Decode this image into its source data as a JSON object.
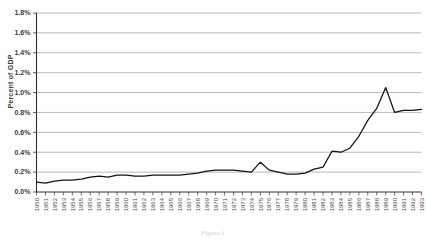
{
  "figure": {
    "caption": "Figure 1"
  },
  "axes": {
    "ylabel": "Percent of GDP",
    "yticks": [
      "0.0%",
      "0.2%",
      "0.4%",
      "0.6%",
      "0.8%",
      "1.0%",
      "1.2%",
      "1.4%",
      "1.6%",
      "1.8%"
    ]
  },
  "chart_data": {
    "type": "line",
    "title": "",
    "subtitle": "",
    "xlabel": "",
    "ylabel": "Percent of GDP",
    "ylim": [
      0.0,
      1.8
    ],
    "ytick_values": [
      0.0,
      0.2,
      0.4,
      0.6,
      0.8,
      1.0,
      1.2,
      1.4,
      1.6,
      1.8
    ],
    "ytick_labels": [
      "0.0%",
      "0.2%",
      "0.4%",
      "0.6%",
      "0.8%",
      "1.0%",
      "1.2%",
      "1.4%",
      "1.6%",
      "1.8%"
    ],
    "grid": "horizontal",
    "legend": "none",
    "annotations": [],
    "categories": [
      "1950",
      "1951",
      "1952",
      "1953",
      "1954",
      "1955",
      "1956",
      "1957",
      "1958",
      "1959",
      "1960",
      "1961",
      "1962",
      "1963",
      "1964",
      "1965",
      "1966",
      "1967",
      "1968",
      "1969",
      "1970",
      "1971",
      "1972",
      "1973",
      "1974",
      "1975",
      "1976",
      "1977",
      "1978",
      "1979",
      "1980",
      "1981",
      "1982",
      "1983",
      "1984",
      "1985",
      "1986",
      "1987",
      "1988",
      "1989",
      "1990",
      "1991",
      "1992",
      "1993"
    ],
    "series": [
      {
        "name": "Percent of GDP",
        "values": [
          0.1,
          0.09,
          0.11,
          0.12,
          0.12,
          0.13,
          0.15,
          0.16,
          0.15,
          0.17,
          0.17,
          0.16,
          0.16,
          0.17,
          0.17,
          0.17,
          0.17,
          0.18,
          0.19,
          0.21,
          0.22,
          0.22,
          0.22,
          0.21,
          0.2,
          0.3,
          0.22,
          0.2,
          0.18,
          0.18,
          0.19,
          0.23,
          0.25,
          0.41,
          0.4,
          0.44,
          0.56,
          0.72,
          0.84,
          1.05,
          0.8,
          0.82,
          0.82,
          0.83
        ]
      }
    ]
  }
}
